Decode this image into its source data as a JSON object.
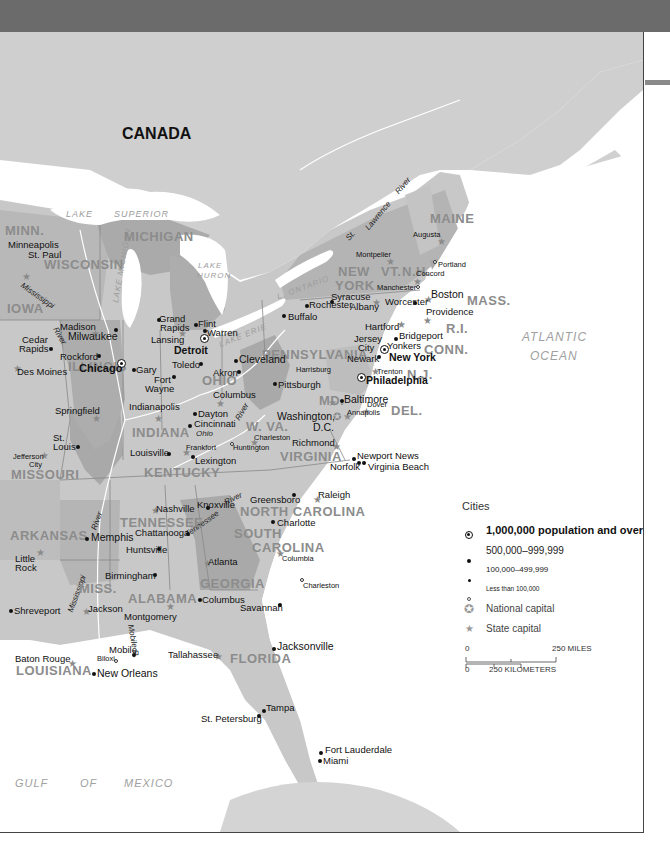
{
  "map": {
    "country_label": "CANADA",
    "water_labels": {
      "lake_superior": [
        "LAKE",
        "SUPERIOR"
      ],
      "lake_michigan": "LAKE MICHIGAN",
      "lake_huron": [
        "LAKE",
        "HURON"
      ],
      "lake_erie": "LAKE ERIE",
      "lake_ontario": "L. ONTARIO",
      "atlantic": [
        "ATLANTIC",
        "OCEAN"
      ],
      "gulf": [
        "GULF",
        "OF",
        "MEXICO"
      ]
    },
    "rivers": {
      "st_lawrence": [
        "St.",
        "Lawrence",
        "River"
      ],
      "mississippi_n": "Mississippi",
      "mississippi_river_n": "River",
      "mississippi_s": "Mississippi",
      "mississippi_river_s": "River",
      "ohio": "Ohio",
      "ohio_river": "River",
      "tennessee": "Tennessee",
      "tennessee_river": "River",
      "mobile": "Mobile R."
    },
    "states": {
      "minn": "MINN.",
      "wisconsin": "WISCONSIN",
      "michigan": "MICHIGAN",
      "iowa": "IOWA",
      "illinois": "ILLINOIS",
      "indiana": "INDIANA",
      "ohio": "OHIO",
      "missouri": "MISSOURI",
      "kentucky": "KENTUCKY",
      "arkansas": "ARKANSAS",
      "tennessee": "TENNESSEE",
      "miss": "MISS.",
      "alabama": "ALABAMA",
      "georgia": "GEORGIA",
      "louisiana": "LOUISIANA",
      "florida": "FLORIDA",
      "south_carolina": [
        "SOUTH",
        "CAROLINA"
      ],
      "north_carolina": "NORTH CAROLINA",
      "virginia": "VIRGINIA",
      "wva": "W. VA.",
      "md": "MD.",
      "del": "DEL.",
      "pennsylvania": "PENNSYLVANIA",
      "nj": "N.J.",
      "new_york": [
        "NEW",
        "YORK"
      ],
      "conn": "CONN.",
      "ri": "R.I.",
      "mass": "MASS.",
      "vt": "VT.",
      "nh": "N.H.",
      "maine": "MAINE"
    },
    "cities": {
      "minneapolis": "Minneapolis",
      "st_paul": "St. Paul",
      "madison": "Madison",
      "milwaukee": "Milwaukee",
      "cedar_rapids": [
        "Cedar",
        "Rapids"
      ],
      "rockford": "Rockford",
      "des_moines": "Des Moines",
      "chicago": "Chicago",
      "gary": "Gary",
      "fort_wayne": [
        "Fort",
        "Wayne"
      ],
      "grand_rapids": [
        "Grand",
        "Rapids"
      ],
      "flint": "Flint",
      "warren": "Warren",
      "lansing": "Lansing",
      "detroit": "Detroit",
      "toledo": "Toledo",
      "akron": "Akron",
      "cleveland": "Cleveland",
      "columbus_oh": "Columbus",
      "dayton": "Dayton",
      "cincinnati": "Cincinnati",
      "indianapolis": "Indianapolis",
      "springfield": "Springfield",
      "st_louis": [
        "St.",
        "Louis"
      ],
      "jefferson_city": [
        "Jefferson",
        "City"
      ],
      "louisville": "Louisville",
      "frankfort": "Frankfort",
      "lexington": "Lexington",
      "huntington": "Huntington",
      "charleston_wv": "Charleston",
      "pittsburgh": "Pittsburgh",
      "harrisburg": "Harrisburg",
      "washington": [
        "Washington,",
        "D.C."
      ],
      "baltimore": "Baltimore",
      "annapolis": "Annapolis",
      "dover": "Dover",
      "philadelphia": "Philadelphia",
      "trenton": "Trenton",
      "newark": "Newark",
      "jersey_city": [
        "Jersey",
        "City"
      ],
      "new_york": "New York",
      "yonkers": "Yonkers",
      "bridgeport": "Bridgeport",
      "hartford": "Hartford",
      "providence": "Providence",
      "boston": "Boston",
      "worcester": "Worcester",
      "manchester": "Manchester",
      "concord": "Concord",
      "portland": "Portland",
      "augusta": "Augusta",
      "montpelier": "Montpelier",
      "albany": "Albany",
      "syracuse": "Syracuse",
      "rochester": "Rochester",
      "buffalo": "Buffalo",
      "richmond": "Richmond",
      "newport_news": "Newport News",
      "norfolk": "Norfolk",
      "virginia_beach": "Virginia Beach",
      "raleigh": "Raleigh",
      "greensboro": "Greensboro",
      "charlotte": "Charlotte",
      "columbia": "Columbia",
      "charleston_sc": "Charleston",
      "nashville": "Nashville",
      "knoxville": "Knoxville",
      "memphis": "Memphis",
      "chattanooga": "Chattanooga",
      "little_rock": [
        "Little",
        "Rock"
      ],
      "huntsville": "Huntsville",
      "birmingham": "Birmingham",
      "atlanta": "Atlanta",
      "columbus_ga": "Columbus",
      "savannah": "Savannah",
      "montgomery": "Montgomery",
      "jackson": "Jackson",
      "shreveport": "Shreveport",
      "baton_rouge": "Baton Rouge",
      "new_orleans": "New Orleans",
      "mobile": "Mobile",
      "biloxi": "Biloxi",
      "tallahassee": "Tallahassee",
      "jacksonville": "Jacksonville",
      "tampa": "Tampa",
      "st_petersburg": "St. Petersburg",
      "fort_lauderdale": "Fort Lauderdale",
      "miami": "Miami"
    },
    "colors": {
      "land_base": "#c8c8c8",
      "land_canada": "#cfcfcf",
      "state_dark": "#a9a9a9",
      "state_mid": "#bdbdbd",
      "state_light": "#d3d3d3",
      "water": "#ffffff",
      "top_band": "#6b6b6b"
    }
  },
  "legend": {
    "title": "Cities",
    "items": [
      {
        "symbol": "circle-dot",
        "label": "1,000,000 population and over"
      },
      {
        "symbol": "large-dot",
        "label": "500,000–999,999"
      },
      {
        "symbol": "small-dot",
        "label": "100,000–499,999"
      },
      {
        "symbol": "open-circle",
        "label": "Less than 100,000"
      },
      {
        "symbol": "circled-star",
        "label": "National capital"
      },
      {
        "symbol": "star",
        "label": "State capital"
      }
    ],
    "scale": {
      "miles_start": "0",
      "miles_end": "250 MILES",
      "km_start": "0",
      "km_end": "250 KILOMETERS"
    }
  }
}
